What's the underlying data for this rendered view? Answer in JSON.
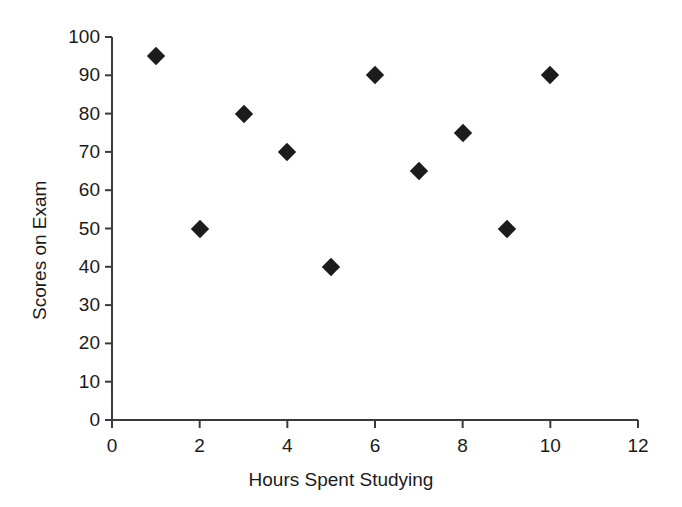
{
  "chart_data": {
    "type": "scatter",
    "title": "",
    "xlabel": "Hours Spent Studying",
    "ylabel": "Scores on Exam",
    "xlim": [
      0,
      12
    ],
    "ylim": [
      0,
      100
    ],
    "xticks": [
      0,
      2,
      4,
      6,
      8,
      10,
      12
    ],
    "yticks": [
      0,
      10,
      20,
      30,
      40,
      50,
      60,
      70,
      80,
      90,
      100
    ],
    "grid": false,
    "legend": false,
    "marker": "diamond",
    "marker_color": "#1c1c1c",
    "axis_color": "#3a3a3a",
    "x": [
      1,
      2,
      3,
      4,
      5,
      6,
      7,
      8,
      9,
      10
    ],
    "y": [
      95,
      50,
      80,
      70,
      40,
      90,
      65,
      75,
      50,
      90
    ],
    "points": [
      {
        "x": 1,
        "y": 95
      },
      {
        "x": 2,
        "y": 50
      },
      {
        "x": 3,
        "y": 80
      },
      {
        "x": 4,
        "y": 70
      },
      {
        "x": 5,
        "y": 40
      },
      {
        "x": 6,
        "y": 90
      },
      {
        "x": 7,
        "y": 65
      },
      {
        "x": 8,
        "y": 75
      },
      {
        "x": 9,
        "y": 50
      },
      {
        "x": 10,
        "y": 90
      }
    ]
  }
}
